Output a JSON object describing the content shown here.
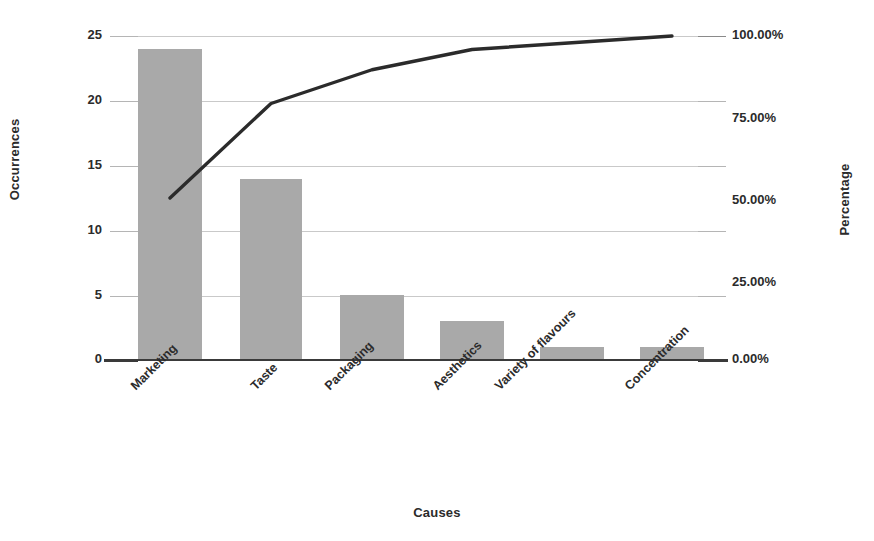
{
  "chart_data": {
    "type": "bar",
    "title": "",
    "subtitle": "",
    "xlabel": "Causes",
    "ylabel": "Occurrences",
    "y2label": "Percentage",
    "categories": [
      "Marketing",
      "Taste",
      "Packaging",
      "Aesthetics",
      "Variety of flavours",
      "Concentration"
    ],
    "series": [
      {
        "name": "Occurrences",
        "type": "bar",
        "axis": "left",
        "values": [
          24,
          14,
          5,
          3,
          1,
          1
        ]
      },
      {
        "name": "Cumulative Percentage",
        "type": "line",
        "axis": "right",
        "values": [
          50.0,
          79.17,
          89.58,
          95.83,
          97.92,
          100.0
        ]
      }
    ],
    "total_occurrences": 48,
    "ylim": [
      0,
      25
    ],
    "y2lim": [
      0,
      100
    ],
    "yticks": [
      0,
      5,
      10,
      15,
      20,
      25
    ],
    "yticklabels": [
      "0",
      "5",
      "10",
      "15",
      "20",
      "25"
    ],
    "y2ticks": [
      0,
      25,
      50,
      75,
      100
    ],
    "y2ticklabels": [
      "0.00%",
      "25.00%",
      "50.00%",
      "75.00%",
      "100.00%"
    ],
    "grid": true,
    "legend": "none",
    "colors": {
      "bar": "#a9a9a9",
      "line": "#2b2b2b",
      "grid": "#c9c9c9",
      "axis": "#3a3a3a",
      "text": "#2b2b2b",
      "background": "#ffffff"
    }
  }
}
